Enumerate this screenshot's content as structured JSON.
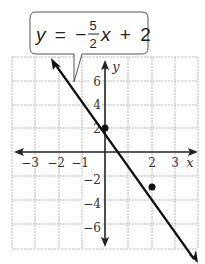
{
  "equation": {
    "lhs": "y",
    "equals": "=",
    "sign": "−",
    "numerator": "5",
    "denominator": "2",
    "var": "x",
    "plus": "+",
    "constant": "2"
  },
  "axes": {
    "x_label": "x",
    "y_label": "y",
    "x_ticks": [
      {
        "value": -3,
        "label": "−3"
      },
      {
        "value": -2,
        "label": "−2"
      },
      {
        "value": -1,
        "label": "−1"
      },
      {
        "value": 2,
        "label": "2"
      },
      {
        "value": 3,
        "label": "3"
      }
    ],
    "y_ticks": [
      {
        "value": 6,
        "label": "6"
      },
      {
        "value": 4,
        "label": "4"
      },
      {
        "value": 2,
        "label": "2"
      },
      {
        "value": -2,
        "label": "−2"
      },
      {
        "value": -4,
        "label": "−4"
      },
      {
        "value": -6,
        "label": "−6"
      }
    ]
  },
  "points": [
    {
      "x": 0,
      "y": 2
    },
    {
      "x": 2,
      "y": -3
    }
  ],
  "colors": {
    "grid": "#b5b5b5",
    "line": "#1a1a1a",
    "text": "#333333"
  }
}
